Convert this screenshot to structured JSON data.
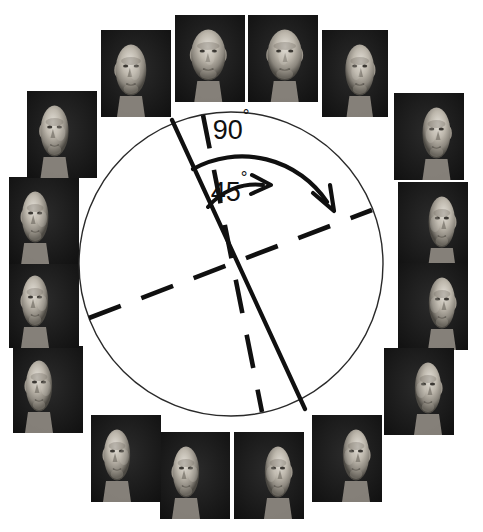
{
  "figure": {
    "background_color": "#ffffff",
    "ink_color": "#101010",
    "width": 483,
    "height": 532
  },
  "circle": {
    "name": "reference-circle",
    "center_x": 231,
    "center_y": 264,
    "radius": 152,
    "stroke_color": "#2a2a2a",
    "stroke_width": 1
  },
  "annotations": {
    "arc_90": {
      "label": "90",
      "degree_symbol": "°",
      "label_x": 231,
      "label_y": 139,
      "font_size": 26,
      "arc_radius": 102,
      "start_angle_deg": -111,
      "end_angle_deg": -21,
      "arrowhead_x": 334,
      "arrowhead_y": 209
    },
    "arc_45": {
      "label": "45",
      "degree_symbol": "°",
      "label_x": 229,
      "label_y": 201,
      "font_size": 26,
      "arc_radius": 62,
      "start_angle_deg": -111,
      "end_angle_deg": -66,
      "arrowhead_x": 270,
      "arrowhead_y": 185
    }
  },
  "axes": [
    {
      "name": "solid-axis-0deg",
      "style": "solid",
      "angle_deg": -111,
      "x1": 172,
      "y1": 120,
      "x2": 305,
      "y2": 409,
      "stroke_width": 4
    },
    {
      "name": "dashed-axis-45deg",
      "style": "dashed",
      "angle_deg": -66,
      "x1": 203,
      "y1": 115,
      "x2": 262,
      "y2": 412,
      "stroke_width": 4
    },
    {
      "name": "dashed-axis-90deg",
      "style": "dashed",
      "angle_deg": -21,
      "x1": 89,
      "y1": 318,
      "x2": 372,
      "y2": 210,
      "stroke_width": 4
    }
  ],
  "face_ring": {
    "count": 16,
    "description": "Sixteen grayscale passport-style photographs of the same bald man's head at successive rotation angles, arranged in a ring around the circle.",
    "items": [
      {
        "id": "face-01",
        "position": "top-center-left",
        "angle_deg": -11,
        "x": 175,
        "y": 15,
        "w": 70,
        "h": 87
      },
      {
        "id": "face-02",
        "position": "top-center-right",
        "angle_deg": 11,
        "x": 248,
        "y": 15,
        "w": 70,
        "h": 87
      },
      {
        "id": "face-03",
        "position": "top-right-inner",
        "angle_deg": 34,
        "x": 322,
        "y": 30,
        "w": 66,
        "h": 87
      },
      {
        "id": "face-04",
        "position": "right-upper",
        "angle_deg": 56,
        "x": 394,
        "y": 93,
        "w": 70,
        "h": 87
      },
      {
        "id": "face-05",
        "position": "right-mid-upper",
        "angle_deg": 79,
        "x": 398,
        "y": 182,
        "w": 70,
        "h": 87
      },
      {
        "id": "face-06",
        "position": "right-mid-lower",
        "angle_deg": 101,
        "x": 398,
        "y": 263,
        "w": 70,
        "h": 87
      },
      {
        "id": "face-07",
        "position": "right-lower",
        "angle_deg": 124,
        "x": 384,
        "y": 348,
        "w": 70,
        "h": 87
      },
      {
        "id": "face-08",
        "position": "bottom-right",
        "angle_deg": 146,
        "x": 312,
        "y": 415,
        "w": 70,
        "h": 87
      },
      {
        "id": "face-09",
        "position": "bottom-center-r",
        "angle_deg": 169,
        "x": 234,
        "y": 432,
        "w": 70,
        "h": 87
      },
      {
        "id": "face-10",
        "position": "bottom-center-l",
        "angle_deg": -169,
        "x": 160,
        "y": 432,
        "w": 70,
        "h": 87
      },
      {
        "id": "face-11",
        "position": "bottom-left",
        "angle_deg": -146,
        "x": 91,
        "y": 415,
        "w": 70,
        "h": 87
      },
      {
        "id": "face-12",
        "position": "left-lower",
        "angle_deg": -124,
        "x": 13,
        "y": 346,
        "w": 70,
        "h": 87
      },
      {
        "id": "face-13",
        "position": "left-mid-lower",
        "angle_deg": -101,
        "x": 9,
        "y": 261,
        "w": 70,
        "h": 87
      },
      {
        "id": "face-14",
        "position": "left-mid-upper",
        "angle_deg": -79,
        "x": 9,
        "y": 177,
        "w": 70,
        "h": 87
      },
      {
        "id": "face-15",
        "position": "left-upper",
        "angle_deg": -56,
        "x": 27,
        "y": 91,
        "w": 70,
        "h": 87
      },
      {
        "id": "face-16",
        "position": "top-left-inner",
        "angle_deg": -34,
        "x": 101,
        "y": 30,
        "w": 70,
        "h": 87
      }
    ]
  }
}
